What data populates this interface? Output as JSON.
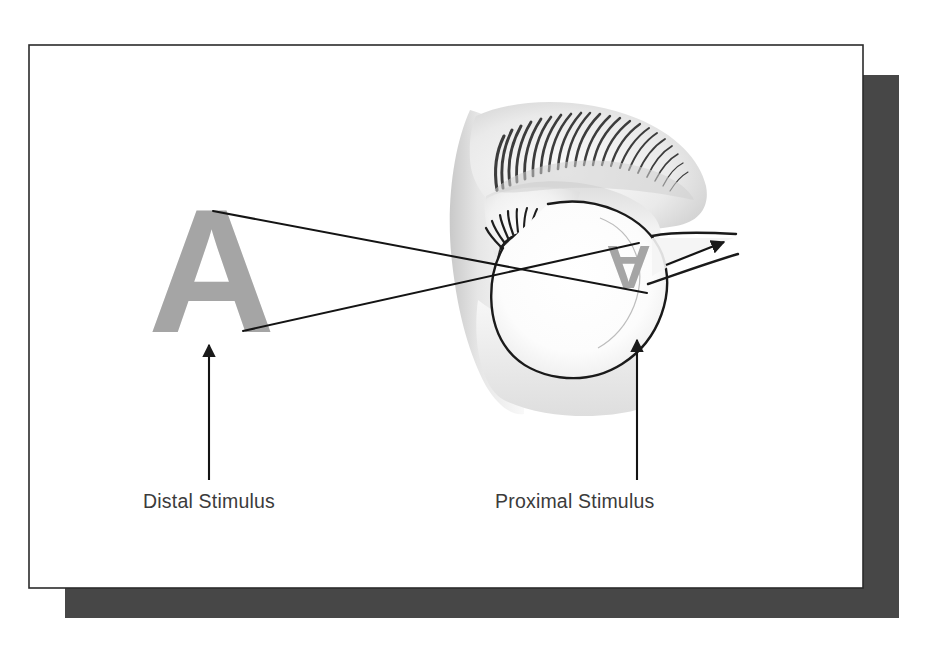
{
  "figure": {
    "background_color": "#ffffff",
    "card": {
      "name": "illustration-card",
      "fill": "#ffffff",
      "border_color": "#2b2b2b",
      "x": 29,
      "y": 45,
      "width": 834,
      "height": 543
    },
    "shadow": {
      "name": "card-drop-shadow",
      "fill": "#474747",
      "x": 65,
      "y": 75,
      "width": 834,
      "height": 543
    },
    "stimulus_letter": {
      "text": "A",
      "color": "#a5a5a5",
      "role": "distal-stimulus-letter"
    },
    "retinal_image_letter": {
      "text": "A",
      "color": "#a5a5a5",
      "role": "inverted-retinal-image",
      "rotation_degrees": 180
    },
    "labels": [
      {
        "id": "distal",
        "text": "Distal Stimulus",
        "color": "#3b3b3b",
        "x": 143,
        "y": 508,
        "pointer": {
          "from_x": 209,
          "from_y": 480,
          "to_x": 209,
          "to_y": 343
        }
      },
      {
        "id": "proximal",
        "text": "Proximal Stimulus",
        "color": "#3b3b3b",
        "x": 495,
        "y": 508,
        "pointer": {
          "from_x": 637,
          "from_y": 480,
          "to_x": 637,
          "to_y": 338
        }
      }
    ],
    "light_rays": {
      "color": "#1a1a1a",
      "stroke_width": 2,
      "rays": [
        {
          "id": "ray-top",
          "x1": 213,
          "y1": 211,
          "x2": 645,
          "y2": 292
        },
        {
          "id": "ray-bottom",
          "x1": 243,
          "y1": 331,
          "x2": 637,
          "y2": 244
        }
      ],
      "crossing_point": {
        "x": 532,
        "y": 269
      }
    },
    "optic_nerve_arrow": {
      "color": "#1a1a1a",
      "x1": 666,
      "y1": 265,
      "x2": 727,
      "y2": 242
    },
    "anatomy": {
      "eyeball_outline_color": "#1a1a1a",
      "skin_tone": "#efefef",
      "iris_color": "#5a5a5a",
      "pupil_color": "#1c1c1c",
      "eyebrow_color": "#3a3a3a"
    }
  }
}
